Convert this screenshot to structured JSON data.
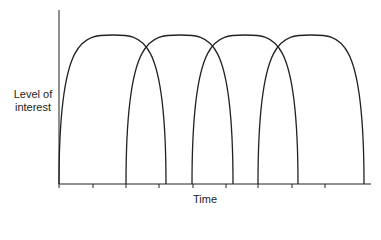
{
  "chart_data": {
    "type": "diagram",
    "title": "",
    "ylabel": "Level of interest",
    "xlabel": "Time",
    "ylabel_lines": [
      "Level of",
      "interest"
    ],
    "axis": {
      "origin_x": 59,
      "baseline_y": 184,
      "top_y": 10,
      "end_x": 371
    },
    "ticks_x": [
      59,
      93,
      126,
      159,
      193,
      226,
      258,
      292,
      325
    ],
    "arcs": [
      {
        "start": 59,
        "peak": 113,
        "end": 166,
        "peak_y": 35
      },
      {
        "start": 126,
        "peak": 180,
        "end": 233,
        "peak_y": 35
      },
      {
        "start": 192,
        "peak": 245,
        "end": 298,
        "peak_y": 35
      },
      {
        "start": 258,
        "peak": 311,
        "end": 364,
        "peak_y": 35
      }
    ],
    "stroke_color": "#222222"
  },
  "labels": {
    "y_line1": "Level of",
    "y_line2": "interest",
    "x": "Time"
  }
}
